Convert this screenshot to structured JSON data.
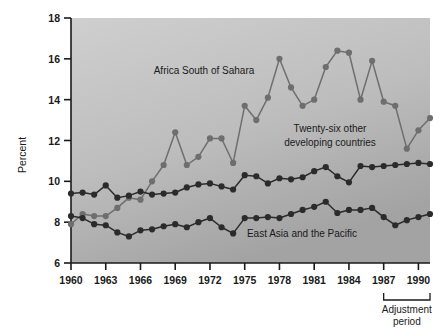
{
  "chart_data": {
    "type": "line",
    "title": "",
    "xlabel": "",
    "ylabel": "Percent",
    "xlim": [
      1960,
      1991
    ],
    "ylim": [
      6,
      18
    ],
    "ytick_values": [
      6,
      8,
      10,
      12,
      14,
      16,
      18
    ],
    "ytick_labels": [
      "6",
      "8",
      "10",
      "12",
      "14",
      "16",
      "18"
    ],
    "xtick_values": [
      1960,
      1963,
      1966,
      1969,
      1972,
      1975,
      1978,
      1981,
      1984,
      1987,
      1990
    ],
    "xtick_labels": [
      "1960",
      "1963",
      "1966",
      "1969",
      "1972",
      "1975",
      "1978",
      "1981",
      "1984",
      "1987",
      "1990"
    ],
    "x": [
      1960,
      1961,
      1962,
      1963,
      1964,
      1965,
      1966,
      1967,
      1968,
      1969,
      1970,
      1971,
      1972,
      1973,
      1974,
      1975,
      1976,
      1977,
      1978,
      1979,
      1980,
      1981,
      1982,
      1983,
      1984,
      1985,
      1986,
      1987,
      1988,
      1989,
      1990,
      1991
    ],
    "grid": false,
    "legend_position": "inline-annotations",
    "series": [
      {
        "name": "Africa South of Sahara",
        "marker_color": "#6e6e6e",
        "line_color": "#6e6e6e",
        "values": [
          7.9,
          8.4,
          8.3,
          8.3,
          8.7,
          9.2,
          9.1,
          10.0,
          10.8,
          12.4,
          10.8,
          11.2,
          12.1,
          12.1,
          10.9,
          13.7,
          13.0,
          14.1,
          16.0,
          14.6,
          13.7,
          14.0,
          15.6,
          16.4,
          16.3,
          14.0,
          15.9,
          13.9,
          13.7,
          11.6,
          12.5,
          13.1
        ]
      },
      {
        "name": "Twenty-six other developing countries",
        "marker_color": "#2b2b2b",
        "line_color": "#2b2b2b",
        "values": [
          9.4,
          9.45,
          9.35,
          9.8,
          9.2,
          9.3,
          9.5,
          9.35,
          9.4,
          9.45,
          9.7,
          9.85,
          9.9,
          9.75,
          9.6,
          10.3,
          10.25,
          9.9,
          10.15,
          10.1,
          10.2,
          10.5,
          10.7,
          10.25,
          9.95,
          10.75,
          10.7,
          10.75,
          10.8,
          10.85,
          10.9,
          10.85
        ]
      },
      {
        "name": "East Asia and the Pacific",
        "marker_color": "#2b2b2b",
        "line_color": "#2b2b2b",
        "values": [
          8.3,
          8.2,
          7.9,
          7.85,
          7.5,
          7.3,
          7.6,
          7.65,
          7.8,
          7.9,
          7.75,
          8.0,
          8.2,
          7.75,
          7.45,
          8.2,
          8.2,
          8.25,
          8.2,
          8.4,
          8.6,
          8.75,
          9.0,
          8.45,
          8.6,
          8.6,
          8.7,
          8.25,
          7.85,
          8.1,
          8.25,
          8.4
        ]
      }
    ],
    "annotations": [
      {
        "name": "africa-label",
        "text": "Africa South of Sahara",
        "x_px": 204,
        "y_px": 74
      },
      {
        "name": "twentysix-label-line1",
        "text": "Twenty-six other",
        "x_px": 330,
        "y_px": 132
      },
      {
        "name": "twentysix-label-line2",
        "text": "developing countries",
        "x_px": 330,
        "y_px": 146
      },
      {
        "name": "eastasia-label",
        "text": "East Asia and the Pacific",
        "x_px": 302,
        "y_px": 237
      }
    ],
    "bracket": {
      "label_line1": "Adjustment",
      "label_line2": "period",
      "start_year": 1987,
      "end_year": 1991
    },
    "colors": {
      "plot_background_top": "#c9c9c9",
      "plot_background_bottom": "#a8a8a8",
      "axis": "#1a1a1a",
      "series_light": "#6e6e6e",
      "series_dark": "#2b2b2b",
      "page_background": "#ffffff"
    }
  }
}
